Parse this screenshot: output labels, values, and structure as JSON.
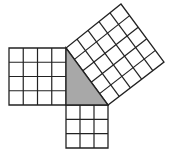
{
  "diagram": {
    "type": "pythagorean-theorem",
    "colors": {
      "background": "#ffffff",
      "line": "#222222",
      "triangle_fill": "#a8a8a8"
    },
    "triangle": {
      "vertices": [
        [
          66,
          48
        ],
        [
          66,
          105
        ],
        [
          108,
          105
        ]
      ],
      "legs": [
        4,
        3
      ],
      "hypotenuse": 5
    },
    "squares": [
      {
        "name": "square-leg-4",
        "side_units": 4,
        "cells": 16,
        "corners": [
          [
            66,
            48
          ],
          [
            66,
            105
          ],
          [
            9,
            105
          ],
          [
            9,
            48
          ]
        ]
      },
      {
        "name": "square-leg-3",
        "side_units": 3,
        "cells": 9,
        "corners": [
          [
            66,
            105
          ],
          [
            108,
            105
          ],
          [
            108,
            148
          ],
          [
            66,
            148
          ]
        ]
      },
      {
        "name": "square-hypotenuse-5",
        "side_units": 5,
        "cells": 25,
        "corners": [
          [
            66,
            48
          ],
          [
            108,
            105
          ],
          [
            164,
            62
          ],
          [
            121,
            4
          ]
        ]
      }
    ]
  }
}
